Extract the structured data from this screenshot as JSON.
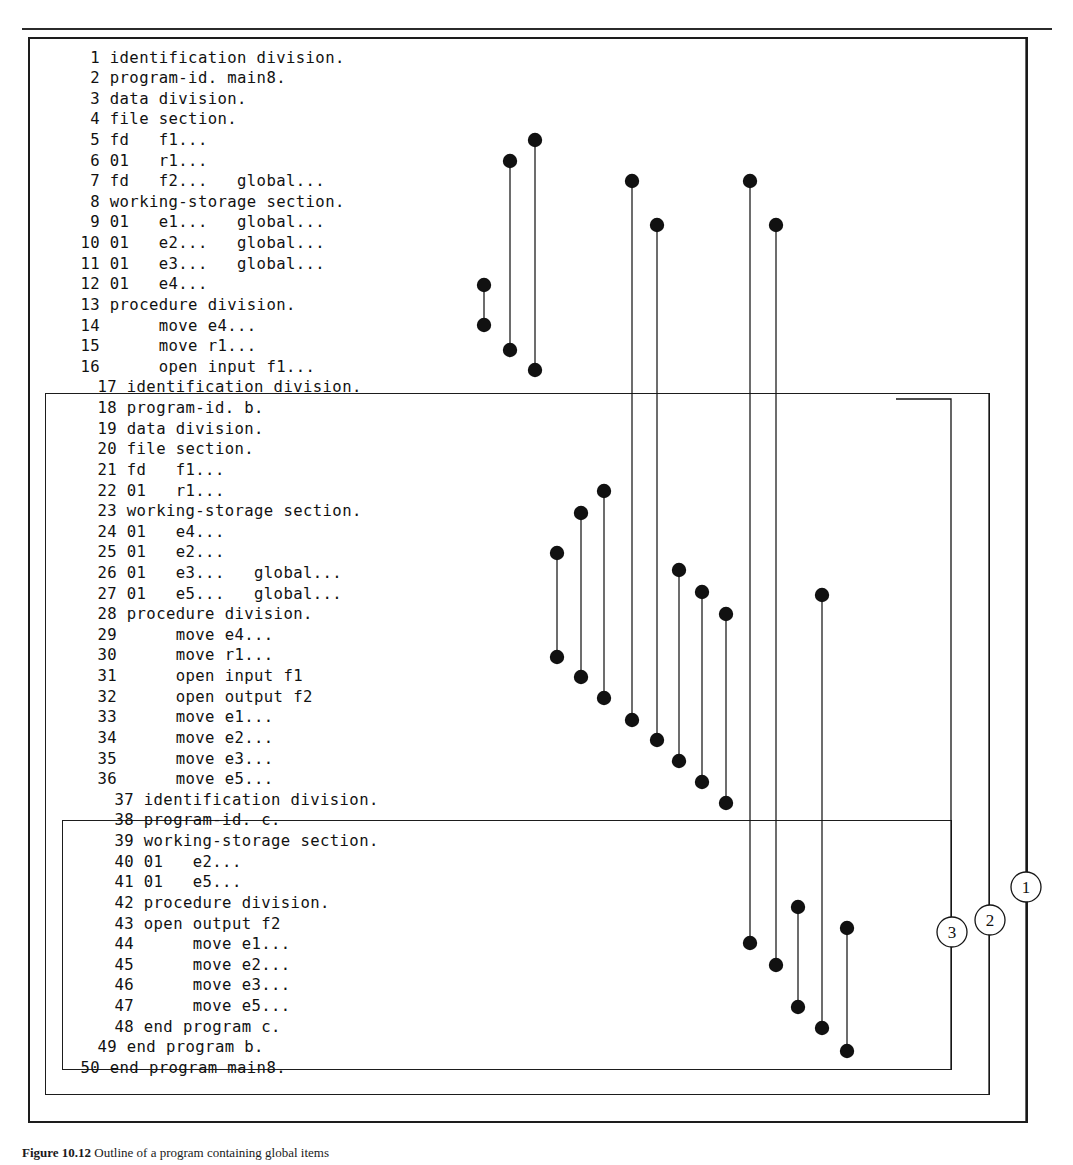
{
  "figure": {
    "caption_bold": "Figure 10.12",
    "caption_rest": " Outline of a program containing global items"
  },
  "programs": [
    {
      "name": "main8",
      "id": "program-main8",
      "start_line": 1,
      "end_line": 50
    },
    {
      "name": "b",
      "id": "program-b",
      "start_line": 17,
      "end_line": 49
    },
    {
      "name": "c",
      "id": "program-c",
      "start_line": 37,
      "end_line": 48
    }
  ],
  "code": {
    "lines": [
      {
        "n": "1",
        "text": "identification division."
      },
      {
        "n": "2",
        "text": "program-id. main8."
      },
      {
        "n": "3",
        "text": "data division."
      },
      {
        "n": "4",
        "text": "file section."
      },
      {
        "n": "5",
        "text": "fd   f1..."
      },
      {
        "n": "6",
        "text": "01   r1..."
      },
      {
        "n": "7",
        "text": "fd   f2...   global..."
      },
      {
        "n": "8",
        "text": "working-storage section."
      },
      {
        "n": "9",
        "text": "01   e1...   global..."
      },
      {
        "n": "10",
        "text": "01   e2...   global..."
      },
      {
        "n": "11",
        "text": "01   e3...   global..."
      },
      {
        "n": "12",
        "text": "01   e4..."
      },
      {
        "n": "13",
        "text": "procedure division."
      },
      {
        "n": "14",
        "text": "     move e4..."
      },
      {
        "n": "15",
        "text": "     move r1..."
      },
      {
        "n": "16",
        "text": "     open input f1..."
      },
      {
        "n": "17",
        "text": "identification division."
      },
      {
        "n": "18",
        "text": "program-id. b."
      },
      {
        "n": "19",
        "text": "data division."
      },
      {
        "n": "20",
        "text": "file section."
      },
      {
        "n": "21",
        "text": "fd   f1..."
      },
      {
        "n": "22",
        "text": "01   r1..."
      },
      {
        "n": "23",
        "text": "working-storage section."
      },
      {
        "n": "24",
        "text": "01   e4..."
      },
      {
        "n": "25",
        "text": "01   e2..."
      },
      {
        "n": "26",
        "text": "01   e3...   global..."
      },
      {
        "n": "27",
        "text": "01   e5...   global..."
      },
      {
        "n": "28",
        "text": "procedure division."
      },
      {
        "n": "29",
        "text": "     move e4..."
      },
      {
        "n": "30",
        "text": "     move r1..."
      },
      {
        "n": "31",
        "text": "     open input f1"
      },
      {
        "n": "32",
        "text": "     open output f2"
      },
      {
        "n": "33",
        "text": "     move e1..."
      },
      {
        "n": "34",
        "text": "     move e2..."
      },
      {
        "n": "35",
        "text": "     move e3..."
      },
      {
        "n": "36",
        "text": "     move e5..."
      },
      {
        "n": "37",
        "text": "identification division."
      },
      {
        "n": "38",
        "text": "program-id. c."
      },
      {
        "n": "39",
        "text": "working-storage section."
      },
      {
        "n": "40",
        "text": "01   e2..."
      },
      {
        "n": "41",
        "text": "01   e5..."
      },
      {
        "n": "42",
        "text": "procedure division."
      },
      {
        "n": "43",
        "text": "open output f2"
      },
      {
        "n": "44",
        "text": "     move e1..."
      },
      {
        "n": "45",
        "text": "     move e2..."
      },
      {
        "n": "46",
        "text": "     move e3..."
      },
      {
        "n": "47",
        "text": "     move e5..."
      },
      {
        "n": "48",
        "text": "end program c."
      },
      {
        "n": "49",
        "text": "end program b."
      },
      {
        "n": "50",
        "text": "end program main8."
      }
    ]
  },
  "markers": [
    {
      "label": "1",
      "cx": 1026,
      "cy": 887
    },
    {
      "label": "2",
      "cx": 990,
      "cy": 920
    },
    {
      "label": "3",
      "cx": 952,
      "cy": 932
    }
  ],
  "connectors": [
    {
      "name": "e4-main-decl-to-move",
      "x": 484,
      "y1": 285,
      "y2": 325
    },
    {
      "name": "r1-main-decl-to-move",
      "x": 510,
      "y1": 161,
      "y2": 350
    },
    {
      "name": "f1-main-decl-to-open",
      "x": 535,
      "y1": 140,
      "y2": 370
    },
    {
      "name": "e4-b-decl-to-move",
      "x": 557,
      "y1": 553,
      "y2": 657
    },
    {
      "name": "r1-b-decl-to-move",
      "x": 581,
      "y1": 513,
      "y2": 677
    },
    {
      "name": "f1-b-decl-to-open",
      "x": 604,
      "y1": 491,
      "y2": 698
    },
    {
      "name": "f2-global-to-b-open",
      "x": 632,
      "y1": 181,
      "y2": 720
    },
    {
      "name": "e1-global-to-b-move",
      "x": 657,
      "y1": 225,
      "y2": 740
    },
    {
      "name": "e3-b-decl-to-move",
      "x": 679,
      "y1": 570,
      "y2": 761
    },
    {
      "name": "e2-b-local-to-move",
      "x": 702,
      "y1": 592,
      "y2": 782
    },
    {
      "name": "e5-b-decl-to-move",
      "x": 726,
      "y1": 614,
      "y2": 803
    },
    {
      "name": "f2-global-to-c-open",
      "x": 750,
      "y1": 181,
      "y2": 943
    },
    {
      "name": "e1-global-to-c-move",
      "x": 776,
      "y1": 225,
      "y2": 965
    },
    {
      "name": "e2-c-decl-to-move",
      "x": 798,
      "y1": 907,
      "y2": 1007
    },
    {
      "name": "e3-global-to-c-move",
      "x": 822,
      "y1": 595,
      "y2": 1028
    },
    {
      "name": "e5-c-decl-to-move",
      "x": 847,
      "y1": 928,
      "y2": 1051
    }
  ],
  "scope_routes": [
    {
      "name": "scope-route-1",
      "label": "1"
    },
    {
      "name": "scope-route-2",
      "label": "2"
    },
    {
      "name": "scope-route-3",
      "label": "3"
    }
  ]
}
